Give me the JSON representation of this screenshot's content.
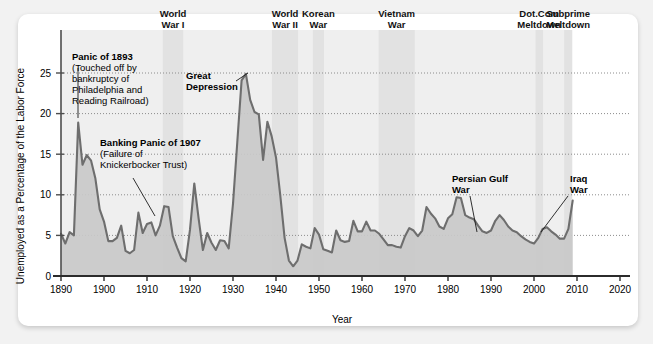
{
  "figure": {
    "background_color": "#f2f2f2",
    "card_color": "#ffffff",
    "line_color": "#6e6e6e",
    "fill_color": "#c9c9c9",
    "band_color": "#e2e2e2",
    "band_color_light": "#efefef",
    "axis_color": "#4d4d4d",
    "grid_color": "#8c8c8c"
  },
  "chart_data": {
    "type": "area",
    "title": "",
    "xlabel": "Year",
    "ylabel": "Unemployed as a Percentage of the Labor Force",
    "xlim": [
      1888,
      2022
    ],
    "ylim": [
      0,
      27
    ],
    "xticks": [
      1890,
      1900,
      1910,
      1920,
      1930,
      1940,
      1950,
      1960,
      1970,
      1980,
      1990,
      2000,
      2010,
      2020
    ],
    "yticks": [
      0,
      5,
      10,
      15,
      20,
      25
    ],
    "grid": "horizontal-dotted",
    "legend": "none",
    "series": [
      {
        "name": "Unemployment rate",
        "x": [
          1890,
          1891,
          1892,
          1893,
          1894,
          1895,
          1896,
          1897,
          1898,
          1899,
          1900,
          1901,
          1902,
          1903,
          1904,
          1905,
          1906,
          1907,
          1908,
          1909,
          1910,
          1911,
          1912,
          1913,
          1914,
          1915,
          1916,
          1917,
          1918,
          1919,
          1920,
          1921,
          1922,
          1923,
          1924,
          1925,
          1926,
          1927,
          1928,
          1929,
          1930,
          1931,
          1932,
          1933,
          1934,
          1935,
          1936,
          1937,
          1938,
          1939,
          1940,
          1941,
          1942,
          1943,
          1944,
          1945,
          1946,
          1947,
          1948,
          1949,
          1950,
          1951,
          1952,
          1953,
          1954,
          1955,
          1956,
          1957,
          1958,
          1959,
          1960,
          1961,
          1962,
          1963,
          1964,
          1965,
          1966,
          1967,
          1968,
          1969,
          1970,
          1971,
          1972,
          1973,
          1974,
          1975,
          1976,
          1977,
          1978,
          1979,
          1980,
          1981,
          1982,
          1983,
          1984,
          1985,
          1986,
          1987,
          1988,
          1989,
          1990,
          1991,
          1992,
          1993,
          1994,
          1995,
          1996,
          1997,
          1998,
          1999,
          2000,
          2001,
          2002,
          2003,
          2004,
          2005,
          2006,
          2007,
          2008,
          2009
        ],
        "values": [
          5.2,
          4.0,
          5.4,
          5.0,
          18.9,
          13.7,
          14.9,
          14.2,
          12.0,
          8.2,
          6.7,
          4.3,
          4.3,
          4.7,
          6.2,
          3.1,
          2.8,
          3.2,
          7.8,
          5.3,
          6.4,
          6.6,
          5.0,
          6.2,
          8.6,
          8.5,
          4.9,
          3.5,
          2.2,
          1.8,
          5.7,
          11.4,
          7.1,
          3.2,
          5.3,
          4.1,
          3.2,
          4.4,
          4.3,
          3.4,
          8.9,
          16.5,
          24.1,
          24.9,
          21.7,
          20.2,
          19.9,
          14.3,
          19.0,
          17.2,
          14.6,
          9.9,
          4.7,
          1.9,
          1.2,
          1.9,
          3.9,
          3.6,
          3.4,
          5.9,
          5.1,
          3.3,
          3.1,
          2.9,
          5.6,
          4.4,
          4.2,
          4.3,
          6.8,
          5.5,
          5.5,
          6.7,
          5.6,
          5.6,
          5.2,
          4.5,
          3.8,
          3.8,
          3.6,
          3.5,
          4.9,
          5.9,
          5.6,
          4.9,
          5.6,
          8.5,
          7.7,
          7.1,
          6.1,
          5.8,
          7.1,
          7.6,
          9.7,
          9.6,
          7.5,
          7.2,
          7.0,
          6.2,
          5.5,
          5.3,
          5.6,
          6.8,
          7.5,
          6.9,
          6.1,
          5.6,
          5.4,
          4.9,
          4.5,
          4.2,
          4.0,
          4.7,
          5.8,
          6.0,
          5.5,
          5.1,
          4.6,
          4.6,
          5.8,
          9.3
        ]
      }
    ],
    "event_bands": [
      {
        "label_line1": "World",
        "label_line2": "War I",
        "start": 1913.6,
        "end": 1918.5,
        "shade": "dark"
      },
      {
        "label_line1": "World",
        "label_line2": "War II",
        "start": 1939.0,
        "end": 1945.2,
        "shade": "dark"
      },
      {
        "label_line1": "Korean",
        "label_line2": "War",
        "start": 1948.5,
        "end": 1951.2,
        "shade": "dark"
      },
      {
        "label_line1": "Vietnam",
        "label_line2": "War",
        "start": 1963.8,
        "end": 1972.3,
        "shade": "dark"
      },
      {
        "label_line1": "Dot.Com",
        "label_line2": "Meltdown",
        "start": 2000.3,
        "end": 2002.1,
        "shade": "dark"
      },
      {
        "label_line1": "Subprime",
        "label_line2": "Meltdown",
        "start": 2007.0,
        "end": 2008.9,
        "shade": "dark"
      }
    ],
    "region_shades": [
      {
        "start": 1890.0,
        "end": 1913.6,
        "shade": "light"
      },
      {
        "start": 1918.5,
        "end": 1939.0,
        "shade": "light"
      },
      {
        "start": 1945.2,
        "end": 1948.5,
        "shade": "light"
      },
      {
        "start": 1951.2,
        "end": 1963.8,
        "shade": "light"
      },
      {
        "start": 1972.3,
        "end": 2000.3,
        "shade": "light"
      },
      {
        "start": 2002.1,
        "end": 2007.0,
        "shade": "light"
      }
    ],
    "annotations": [
      {
        "id": "panic-1893",
        "lines": [
          {
            "text": "Panic of 1893",
            "bold": true
          },
          {
            "text": "(Touched off by",
            "bold": false
          },
          {
            "text": "bankruptcy of",
            "bold": false
          },
          {
            "text": "Philadelphia and",
            "bold": false
          },
          {
            "text": "Reading Railroad)",
            "bold": false
          }
        ],
        "text_x": 72,
        "text_y": 60,
        "leader": [
          [
            78,
            68
          ],
          [
            78,
            118
          ]
        ]
      },
      {
        "id": "banking-panic-1907",
        "lines": [
          {
            "text": "Banking Panic of 1907",
            "bold": true
          },
          {
            "text": "(Failure of",
            "bold": false
          },
          {
            "text": "Knickerbocker Trust)",
            "bold": false
          }
        ],
        "text_x": 100,
        "text_y": 146,
        "leader": [
          [
            133,
            178
          ],
          [
            155,
            216
          ]
        ]
      },
      {
        "id": "great-depression",
        "lines": [
          {
            "text": "Great",
            "bold": true
          },
          {
            "text": "Depression",
            "bold": true
          }
        ],
        "text_x": 186,
        "text_y": 79,
        "leader": [
          [
            236,
            81
          ],
          [
            248,
            73
          ]
        ]
      },
      {
        "id": "persian-gulf-war",
        "lines": [
          {
            "text": "Persian Gulf",
            "bold": true
          },
          {
            "text": "War",
            "bold": true
          }
        ],
        "text_x": 452,
        "text_y": 182,
        "leader": [
          [
            470,
            196
          ],
          [
            477,
            232
          ]
        ]
      },
      {
        "id": "iraq-war",
        "lines": [
          {
            "text": "Iraq",
            "bold": true
          },
          {
            "text": "War",
            "bold": true
          }
        ],
        "text_x": 570,
        "text_y": 182,
        "leader": [
          [
            568,
            196
          ],
          [
            541,
            232
          ]
        ]
      }
    ]
  }
}
